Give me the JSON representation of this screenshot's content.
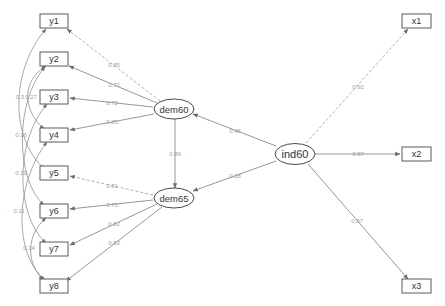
{
  "diagram": {
    "type": "SEM path diagram",
    "colors": {
      "node_stroke": "#5a5a5a",
      "edge": "#8a8a8a",
      "edge_label": "#a0a0a0",
      "background": "#ffffff"
    },
    "latent_nodes": [
      {
        "id": "dem60",
        "label": "dem60",
        "cx": 174,
        "cy": 109
      },
      {
        "id": "dem65",
        "label": "dem65",
        "cx": 174,
        "cy": 198
      },
      {
        "id": "ind60",
        "label": "ind60",
        "cx": 294,
        "cy": 153
      }
    ],
    "observed_nodes": [
      {
        "id": "y1",
        "label": "y1",
        "x": 40,
        "y": 14
      },
      {
        "id": "y2",
        "label": "y2",
        "x": 40,
        "y": 52
      },
      {
        "id": "y3",
        "label": "y3",
        "x": 40,
        "y": 90
      },
      {
        "id": "y4",
        "label": "y4",
        "x": 40,
        "y": 128
      },
      {
        "id": "y5",
        "label": "y5",
        "x": 40,
        "y": 166
      },
      {
        "id": "y6",
        "label": "y6",
        "x": 40,
        "y": 204
      },
      {
        "id": "y7",
        "label": "y7",
        "x": 40,
        "y": 242
      },
      {
        "id": "y8",
        "label": "y8",
        "x": 40,
        "y": 279
      },
      {
        "id": "x1",
        "label": "x1",
        "x": 402,
        "y": 14
      },
      {
        "id": "x2",
        "label": "x2",
        "x": 402,
        "y": 147
      },
      {
        "id": "x3",
        "label": "x3",
        "x": 402,
        "y": 279
      }
    ],
    "loadings": [
      {
        "from": "dem60",
        "to": "y1",
        "label": "0.85",
        "dashed": true
      },
      {
        "from": "dem60",
        "to": "y2",
        "label": "0.72",
        "dashed": false
      },
      {
        "from": "dem60",
        "to": "y3",
        "label": "0.72",
        "dashed": false
      },
      {
        "from": "dem60",
        "to": "y4",
        "label": "0.85",
        "dashed": false
      },
      {
        "from": "dem65",
        "to": "y5",
        "label": "0.81",
        "dashed": true
      },
      {
        "from": "dem65",
        "to": "y6",
        "label": "0.75",
        "dashed": false
      },
      {
        "from": "dem65",
        "to": "y7",
        "label": "0.82",
        "dashed": false
      },
      {
        "from": "dem65",
        "to": "y8",
        "label": "0.83",
        "dashed": false
      },
      {
        "from": "ind60",
        "to": "x1",
        "label": "0.92",
        "dashed": true
      },
      {
        "from": "ind60",
        "to": "x2",
        "label": "0.97",
        "dashed": false
      },
      {
        "from": "ind60",
        "to": "x3",
        "label": "0.87",
        "dashed": false
      }
    ],
    "regressions": [
      {
        "from": "ind60",
        "to": "dem60",
        "label": "0.45"
      },
      {
        "from": "ind60",
        "to": "dem65",
        "label": "0.18"
      },
      {
        "from": "dem60",
        "to": "dem65",
        "label": "0.89"
      }
    ],
    "covariances": [
      {
        "between": [
          "y1",
          "y5"
        ],
        "label": "0.3"
      },
      {
        "between": [
          "y2",
          "y4"
        ],
        "label": "0.27"
      },
      {
        "between": [
          "y2",
          "y6"
        ],
        "label": "0.36"
      },
      {
        "between": [
          "y3",
          "y7"
        ],
        "label": "0.19"
      },
      {
        "between": [
          "y4",
          "y8"
        ],
        "label": "0.11"
      },
      {
        "between": [
          "y6",
          "y8"
        ],
        "label": "0.34"
      }
    ],
    "caption": "████ ███ █████ ██████"
  }
}
